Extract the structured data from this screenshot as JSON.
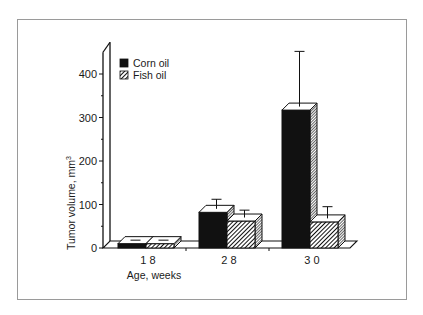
{
  "chart_data": {
    "type": "bar",
    "style": "3d-grouped-bar-with-error-bars",
    "title": "",
    "xlabel": "Age, weeks",
    "ylabel": "Tumor volume, mm",
    "ylabel_superscript": "3",
    "ylim": [
      0,
      450
    ],
    "yticks": [
      "0",
      "100",
      "200",
      "300",
      "400"
    ],
    "categories": [
      "1 8",
      "2 8",
      "3 0"
    ],
    "series": [
      {
        "name": "Corn oil",
        "fill": "solid-black",
        "values": [
          10,
          82,
          317
        ],
        "error_upper": [
          18,
          112,
          452
        ]
      },
      {
        "name": "Fish oil",
        "fill": "diagonal-hatch",
        "values": [
          10,
          62,
          60
        ],
        "error_upper": [
          18,
          87,
          95
        ]
      }
    ],
    "legend": {
      "position": "upper-left",
      "entries": [
        "Corn oil",
        "Fish oil"
      ]
    },
    "grid": false
  },
  "colors": {
    "bar_dark": "#111111",
    "frame": "#9a9a9a",
    "text": "#1a1a1a"
  }
}
